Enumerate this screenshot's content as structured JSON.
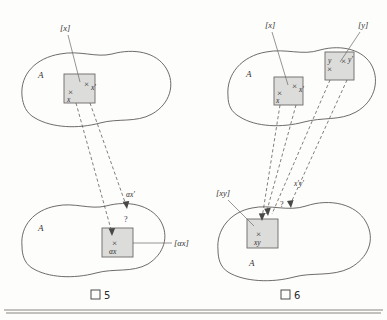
{
  "figures": [
    {
      "id": "figure-5",
      "caption_symbol": "図",
      "caption_number": "5",
      "caption_full": "図 5",
      "top_region": {
        "set_label": "A",
        "bracket_label": "[x]",
        "box_marks": [
          {
            "cross": "×",
            "name": "x"
          },
          {
            "cross": "×",
            "name": "x'"
          }
        ]
      },
      "bottom_region": {
        "set_label": "A",
        "bracket_label": "[αx]",
        "box_marks": [
          {
            "cross": "×",
            "name": "αx"
          }
        ],
        "floating_label": "αx'",
        "question_mark": "?"
      }
    },
    {
      "id": "figure-6",
      "caption_symbol": "図",
      "caption_number": "6",
      "caption_full": "図 6",
      "top_region": {
        "set_label": "A",
        "bracket_label_left": "[x]",
        "bracket_label_right": "[y]",
        "box_left_marks": [
          {
            "cross": "×",
            "name": "x"
          },
          {
            "cross": "×",
            "name": "x'"
          }
        ],
        "box_right_marks": [
          {
            "cross": "×",
            "name": "y"
          },
          {
            "cross": "×",
            "name": "y'"
          }
        ]
      },
      "bottom_region": {
        "set_label": "A",
        "bracket_label": "[xy]",
        "box_marks": [
          {
            "cross": "×",
            "name": "xy"
          }
        ],
        "floating_label": "x'y'",
        "question_mark": "?"
      }
    }
  ],
  "colors": {
    "ink": "#33312f",
    "line": "#5d5b58",
    "box_fill": "#cfcfcf",
    "page": "#fdfdfc"
  }
}
